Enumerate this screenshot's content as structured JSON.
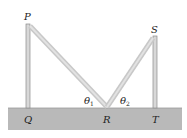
{
  "diagram": {
    "labels": {
      "P": "P",
      "S": "S",
      "Q": "Q",
      "R": "R",
      "T": "T",
      "theta1": "θ",
      "theta1_sub": "1",
      "theta2": "θ",
      "theta2_sub": "2"
    },
    "colors": {
      "ground": "#b9b9b9",
      "pole": "#d6d6d6",
      "pole_edge": "#8c8c8c",
      "wire": "#cfcfcf"
    }
  }
}
